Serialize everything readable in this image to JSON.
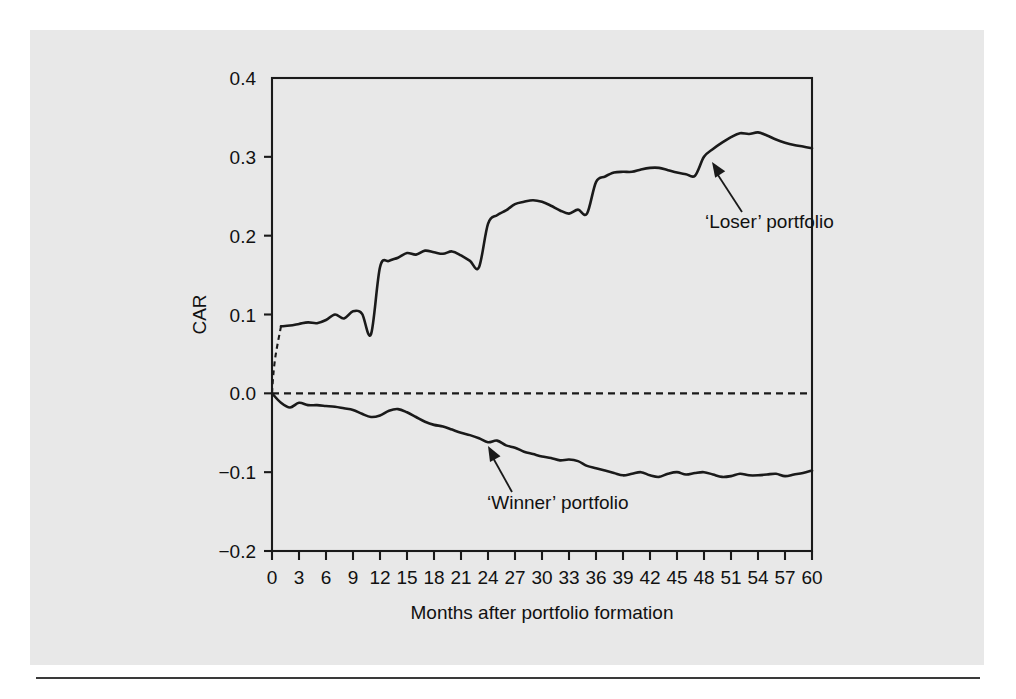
{
  "figure": {
    "background_color": "#e8e8e8",
    "line_color": "#1a1a1a"
  },
  "chart_data": {
    "type": "line",
    "title": "",
    "xlabel": "Months after portfolio formation",
    "ylabel": "CAR",
    "xlim": [
      0,
      60
    ],
    "ylim": [
      -0.2,
      0.4
    ],
    "grid": false,
    "legend": "annotations",
    "xticks": [
      0,
      3,
      6,
      9,
      12,
      15,
      18,
      21,
      24,
      27,
      30,
      33,
      36,
      39,
      42,
      45,
      48,
      51,
      54,
      57,
      60
    ],
    "xtick_labels": [
      "0",
      "3",
      "6",
      "9",
      "12",
      "15",
      "18",
      "21",
      "24",
      "27",
      "30",
      "33",
      "36",
      "39",
      "42",
      "45",
      "48",
      "51",
      "54",
      "57",
      "60"
    ],
    "yticks": [
      -0.2,
      -0.1,
      0.0,
      0.1,
      0.2,
      0.3,
      0.4
    ],
    "ytick_labels": [
      "−0.2",
      "−0.1",
      "0.0",
      "0.1",
      "0.2",
      "0.3",
      "0.4"
    ],
    "zero_reference_line": 0.0,
    "annotations": [
      {
        "text": "‘Loser’ portfolio",
        "points_to_month": 48,
        "points_to_value": 0.285
      },
      {
        "text": "‘Winner’ portfolio",
        "points_to_month": 24,
        "points_to_value": -0.062
      }
    ],
    "series": [
      {
        "name": "'Loser' portfolio",
        "style": "solid",
        "lead_in_style": "dashed",
        "x": [
          0,
          1,
          2,
          3,
          4,
          5,
          6,
          7,
          8,
          9,
          10,
          11,
          12,
          13,
          14,
          15,
          16,
          17,
          18,
          19,
          20,
          21,
          22,
          23,
          24,
          25,
          26,
          27,
          28,
          29,
          30,
          31,
          32,
          33,
          34,
          35,
          36,
          37,
          38,
          39,
          40,
          41,
          42,
          43,
          44,
          45,
          46,
          47,
          48,
          49,
          50,
          51,
          52,
          53,
          54,
          55,
          56,
          57,
          58,
          59,
          60
        ],
        "values": [
          0.0,
          0.085,
          0.086,
          0.088,
          0.09,
          0.089,
          0.093,
          0.1,
          0.095,
          0.104,
          0.101,
          0.075,
          0.16,
          0.168,
          0.172,
          0.178,
          0.176,
          0.181,
          0.179,
          0.177,
          0.18,
          0.175,
          0.168,
          0.16,
          0.215,
          0.226,
          0.232,
          0.24,
          0.243,
          0.245,
          0.243,
          0.238,
          0.232,
          0.228,
          0.233,
          0.228,
          0.268,
          0.275,
          0.28,
          0.281,
          0.281,
          0.284,
          0.286,
          0.286,
          0.283,
          0.28,
          0.278,
          0.276,
          0.3,
          0.31,
          0.318,
          0.325,
          0.33,
          0.329,
          0.331,
          0.327,
          0.322,
          0.318,
          0.315,
          0.313,
          0.311
        ]
      },
      {
        "name": "'Winner' portfolio",
        "style": "solid",
        "x": [
          0,
          1,
          2,
          3,
          4,
          5,
          6,
          7,
          8,
          9,
          10,
          11,
          12,
          13,
          14,
          15,
          16,
          17,
          18,
          19,
          20,
          21,
          22,
          23,
          24,
          25,
          26,
          27,
          28,
          29,
          30,
          31,
          32,
          33,
          34,
          35,
          36,
          37,
          38,
          39,
          40,
          41,
          42,
          43,
          44,
          45,
          46,
          47,
          48,
          49,
          50,
          51,
          52,
          53,
          54,
          55,
          56,
          57,
          58,
          59,
          60
        ],
        "values": [
          0.0,
          -0.012,
          -0.018,
          -0.012,
          -0.015,
          -0.015,
          -0.016,
          -0.017,
          -0.019,
          -0.021,
          -0.026,
          -0.03,
          -0.028,
          -0.022,
          -0.02,
          -0.024,
          -0.03,
          -0.036,
          -0.04,
          -0.042,
          -0.046,
          -0.05,
          -0.053,
          -0.057,
          -0.062,
          -0.06,
          -0.066,
          -0.069,
          -0.074,
          -0.077,
          -0.08,
          -0.082,
          -0.085,
          -0.084,
          -0.086,
          -0.092,
          -0.095,
          -0.098,
          -0.101,
          -0.104,
          -0.102,
          -0.1,
          -0.104,
          -0.106,
          -0.102,
          -0.1,
          -0.103,
          -0.101,
          -0.1,
          -0.103,
          -0.106,
          -0.105,
          -0.102,
          -0.104,
          -0.104,
          -0.103,
          -0.102,
          -0.105,
          -0.103,
          -0.101,
          -0.098
        ]
      }
    ]
  }
}
